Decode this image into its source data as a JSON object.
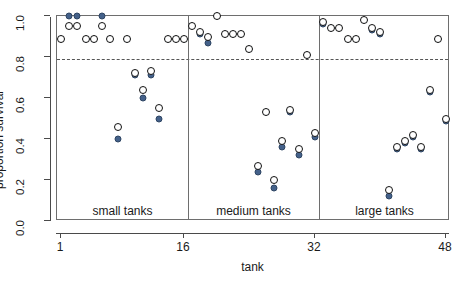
{
  "chart_data": {
    "type": "scatter",
    "title": "",
    "xlabel": "tank",
    "ylabel": "proportion survival",
    "xlim": [
      0.5,
      48.5
    ],
    "ylim": [
      0.0,
      1.0
    ],
    "grid": false,
    "legend": null,
    "xticks": [
      "1",
      "16",
      "32",
      "48"
    ],
    "xtick_values": [
      1,
      16,
      32,
      48
    ],
    "yticks": [
      "0.0",
      "0.2",
      "0.4",
      "0.6",
      "0.8",
      "1.0"
    ],
    "ytick_values": [
      0.0,
      0.2,
      0.4,
      0.6,
      0.8,
      1.0
    ],
    "reference_line": {
      "y": 0.79,
      "style": "dashed",
      "color": "#555555"
    },
    "group_dividers": [
      16.5,
      32.5
    ],
    "annotations": [
      {
        "text": "small tanks",
        "x": 8.5,
        "y": 0.045
      },
      {
        "text": "medium tanks",
        "x": 24.5,
        "y": 0.045
      },
      {
        "text": "large tanks",
        "x": 40.5,
        "y": 0.045
      }
    ],
    "series": [
      {
        "name": "observed",
        "marker": "open-circle",
        "color": "#111111",
        "fill": "#ffffff",
        "x": [
          1,
          2,
          3,
          4,
          5,
          6,
          7,
          8,
          9,
          10,
          11,
          12,
          13,
          14,
          15,
          16,
          17,
          18,
          19,
          20,
          21,
          22,
          23,
          24,
          25,
          26,
          27,
          28,
          29,
          30,
          31,
          32,
          33,
          34,
          35,
          36,
          37,
          38,
          39,
          40,
          41,
          42,
          43,
          44,
          45,
          46,
          47,
          48
        ],
        "values": [
          0.89,
          0.95,
          0.95,
          0.89,
          0.89,
          0.95,
          0.89,
          0.46,
          0.89,
          0.72,
          0.64,
          0.73,
          0.55,
          0.89,
          0.89,
          0.89,
          0.95,
          0.92,
          0.9,
          1.0,
          0.91,
          0.91,
          0.91,
          0.84,
          0.27,
          0.53,
          0.2,
          0.39,
          0.54,
          0.35,
          0.81,
          0.43,
          0.97,
          0.94,
          0.94,
          0.89,
          0.89,
          0.98,
          0.94,
          0.92,
          0.15,
          0.36,
          0.39,
          0.42,
          0.36,
          0.64,
          0.89,
          0.5
        ]
      },
      {
        "name": "predicted",
        "marker": "filled-circle",
        "color": "#44618a",
        "x": [
          1,
          2,
          3,
          4,
          5,
          6,
          7,
          8,
          9,
          10,
          11,
          12,
          13,
          14,
          15,
          16,
          17,
          18,
          19,
          20,
          21,
          22,
          23,
          24,
          25,
          26,
          27,
          28,
          29,
          30,
          31,
          32,
          33,
          34,
          35,
          36,
          37,
          38,
          39,
          40,
          41,
          42,
          43,
          44,
          45,
          46,
          47,
          48
        ],
        "values": [
          0.89,
          1.0,
          1.0,
          0.89,
          0.89,
          1.0,
          0.89,
          0.4,
          0.89,
          0.71,
          0.6,
          0.71,
          0.5,
          0.89,
          0.89,
          0.89,
          0.95,
          0.91,
          0.87,
          1.0,
          0.91,
          0.91,
          0.91,
          0.84,
          0.24,
          0.53,
          0.16,
          0.36,
          0.53,
          0.32,
          0.81,
          0.41,
          0.96,
          0.94,
          0.94,
          0.89,
          0.89,
          0.98,
          0.93,
          0.91,
          0.12,
          0.35,
          0.38,
          0.41,
          0.35,
          0.63,
          0.89,
          0.49
        ]
      }
    ]
  },
  "axes": {
    "y_title": "proportion survival",
    "x_title": "tank"
  }
}
